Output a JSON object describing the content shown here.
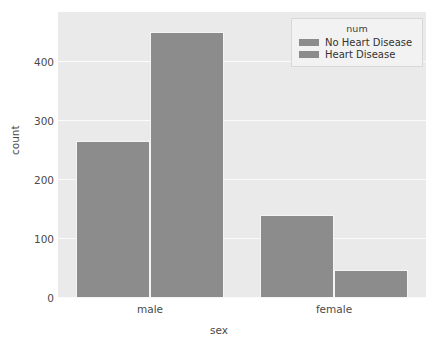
{
  "chart_data": {
    "type": "bar",
    "title": "",
    "subtitle": "",
    "xlabel": "sex",
    "ylabel": "count",
    "categories": [
      "male",
      "female"
    ],
    "series": [
      {
        "name": "No Heart Disease",
        "values": [
          265,
          140
        ],
        "color": "#8c8c8c"
      },
      {
        "name": "Heart Disease",
        "values": [
          450,
          48
        ],
        "color": "#8c8c8c"
      }
    ],
    "legend": {
      "title": "num",
      "position": "upper right",
      "entries": [
        "No Heart Disease",
        "Heart Disease"
      ]
    },
    "ylim": [
      0,
      484
    ],
    "yticks": [
      0,
      100,
      200,
      300,
      400
    ],
    "ytick_labels": [
      "0",
      "100",
      "200",
      "300",
      "400"
    ],
    "xtick_labels": [
      "male",
      "female"
    ],
    "grid": true,
    "grid_axis": "y",
    "axes_facecolor": "#eaeaea",
    "grid_color": "#fbfbfb",
    "figure_facecolor": "#ffffff",
    "bar_color": "#8c8c8c",
    "tick_color": "#4a4a4a"
  },
  "artifacts": {
    "bleed_through_lines": [
      "an 2.0 the as commit the and",
      "and the for that a summary",
      "a here to the read of a the",
      "and to the there are of an",
      "the sum of three seen and",
      "the full that and cases of a",
      "of the because and all in a",
      "the and our the disease an",
      "a common and the fall on it",
      "the so a that sure the data",
      "of the read and in the value",
      "a set the and on the count a",
      "the of the more in and that",
      "the a number and set of the",
      "are of in the column of a set",
      "to the and the a data frame",
      "of a the number and in the",
      "a read of the value and set",
      "the count and the of data a",
      "and the in of a the set for"
    ]
  }
}
